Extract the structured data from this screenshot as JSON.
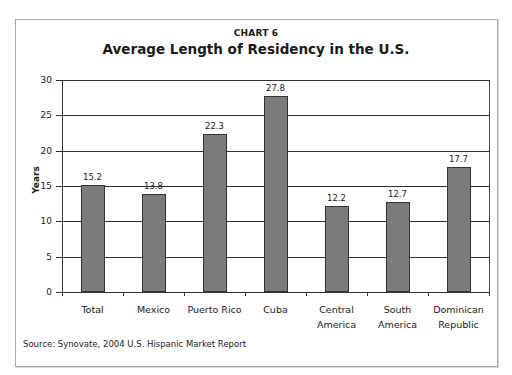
{
  "header": {
    "chart_number": "CHART 6",
    "title": "Average Length of Residency in the U.S."
  },
  "axis": {
    "ylabel": "Years",
    "yticks": [
      "0",
      "5",
      "10",
      "15",
      "20",
      "25",
      "30"
    ]
  },
  "bars": [
    {
      "label_line1": "Total",
      "label_line2": "",
      "value": 15.2,
      "value_label": "15.2"
    },
    {
      "label_line1": "Mexico",
      "label_line2": "",
      "value": 13.8,
      "value_label": "13.8"
    },
    {
      "label_line1": "Puerto Rico",
      "label_line2": "",
      "value": 22.3,
      "value_label": "22.3"
    },
    {
      "label_line1": "Cuba",
      "label_line2": "",
      "value": 27.8,
      "value_label": "27.8"
    },
    {
      "label_line1": "Central",
      "label_line2": "America",
      "value": 12.2,
      "value_label": "12.2"
    },
    {
      "label_line1": "South",
      "label_line2": "America",
      "value": 12.7,
      "value_label": "12.7"
    },
    {
      "label_line1": "Dominican",
      "label_line2": "Republic",
      "value": 17.7,
      "value_label": "17.7"
    }
  ],
  "footer": {
    "source": "Source: Synovate, 2004 U.S. Hispanic Market Report"
  },
  "colors": {
    "bar_fill": "#7c7c7c",
    "bar_border": "#333333",
    "gridline": "#333333",
    "frame_border": "#a9a9a9"
  },
  "chart_data": {
    "type": "bar",
    "title": "Average Length of Residency in the U.S.",
    "subtitle": "CHART 6",
    "categories": [
      "Total",
      "Mexico",
      "Puerto Rico",
      "Cuba",
      "Central America",
      "South America",
      "Dominican Republic"
    ],
    "values": [
      15.2,
      13.8,
      22.3,
      27.8,
      12.2,
      12.7,
      17.7
    ],
    "xlabel": "",
    "ylabel": "Years",
    "ylim": [
      0,
      30
    ],
    "yticks": [
      0,
      5,
      10,
      15,
      20,
      25,
      30
    ],
    "grid": true,
    "legend": null,
    "annotations": [
      "Source: Synovate, 2004 U.S. Hispanic Market Report"
    ]
  }
}
